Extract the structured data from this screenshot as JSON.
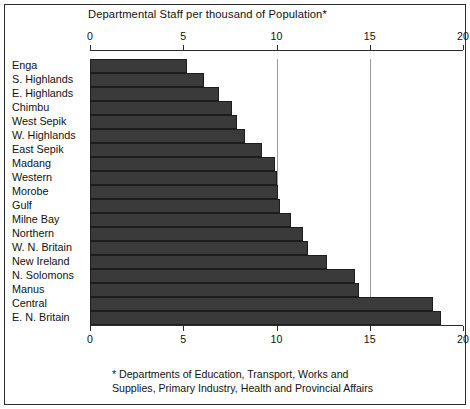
{
  "chart_data": {
    "type": "bar",
    "orientation": "horizontal",
    "title": "Departmental Staff per thousand of Population*",
    "xlabel": "",
    "ylabel": "",
    "xlim": [
      0,
      20
    ],
    "xticks": [
      0,
      5,
      10,
      15,
      20
    ],
    "xtick_labels": [
      "0",
      "5",
      "10",
      "15",
      "20"
    ],
    "grid": "vertical gridlines at 10 and 15",
    "gridlines": [
      10,
      15
    ],
    "axis_positions": [
      "top",
      "bottom"
    ],
    "legend": null,
    "categories": [
      "Enga",
      "S. Highlands",
      "E. Highlands",
      "Chimbu",
      "West Sepik",
      "W. Highlands",
      "East Sepik",
      "Madang",
      "Western",
      "Morobe",
      "Gulf",
      "Milne Bay",
      "Northern",
      "W. N. Britain",
      "New Ireland",
      "N. Solomons",
      "Manus",
      "Central",
      "E. N. Britain"
    ],
    "values": [
      5.2,
      6.1,
      6.9,
      7.6,
      7.9,
      8.3,
      9.2,
      9.9,
      10.0,
      10.1,
      10.2,
      10.8,
      11.4,
      11.7,
      12.7,
      14.2,
      14.4,
      18.4,
      18.8
    ],
    "annotations": [
      "* Departments of Education, Transport, Works and\nSupplies, Primary Industry, Health and Provincial Affairs"
    ],
    "footnote": "* Departments of Education, Transport, Works and\nSupplies, Primary Industry, Health and Provincial Affairs",
    "bar_color": "#3a3a3a",
    "bar_edge_color": "#1d1d1d",
    "gridline_color": "#9a9a9a",
    "axis_color": "#2b2b2b",
    "background_color": "#ffffff"
  }
}
